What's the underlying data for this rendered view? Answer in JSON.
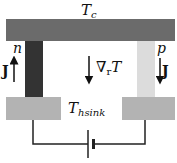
{
  "labels": {
    "cold_side": "T",
    "cold_side_sub": "c",
    "n_leg": "n",
    "p_leg": "p",
    "heat_sink": "T",
    "heat_sink_sub": "hsink",
    "current_left": "J",
    "current_right": "J",
    "gradient_symbol": "∇",
    "gradient_sub": "r",
    "gradient_var": "T"
  },
  "colors": {
    "top_bar": "#6b6b6b",
    "n_leg": "#333333",
    "p_leg": "#dcdcdc",
    "heat_sink": "#b3b3b3",
    "wire": "#222222"
  }
}
